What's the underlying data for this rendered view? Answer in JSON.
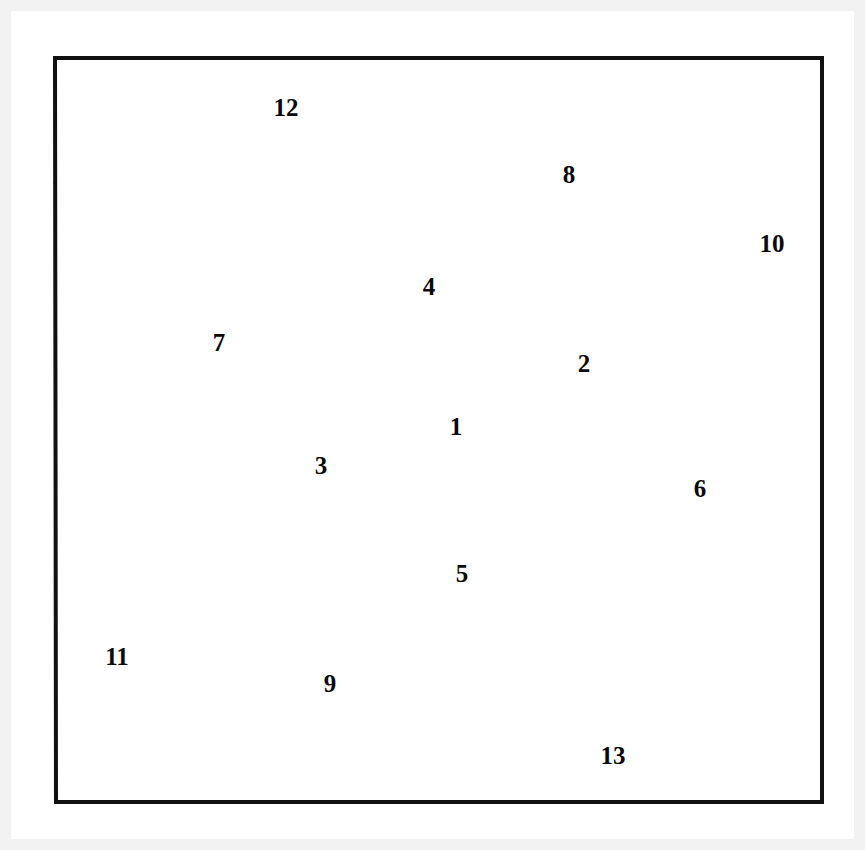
{
  "figure": {
    "title_visible": false,
    "background_color": "#ffffff",
    "matte_color": "#f2f2f2",
    "line_color": "#111111",
    "label_color": "#0a0a0a",
    "frame": {
      "stroke_width": 4,
      "points": "55,58 822,58 822,802 56,802"
    },
    "partition_stroke_width": 2.6,
    "region_count": 13,
    "regions": [
      {
        "id": "region-1",
        "label": "1",
        "label_x": 456,
        "label_y": 429,
        "polygon": "312,364 503,317 563,502 363,515"
      },
      {
        "id": "region-2",
        "label": "2",
        "label_x": 584,
        "label_y": 366,
        "polygon": "503,317 653,275 598,493 563,502"
      },
      {
        "id": "region-3",
        "label": "3",
        "label_x": 321,
        "label_y": 468,
        "polygon": "280,368 312,364 363,515 228,586"
      },
      {
        "id": "region-4",
        "label": "4",
        "label_x": 429,
        "label_y": 289,
        "polygon": "310,228 662,247 653,275 503,317 312,364 280,368"
      },
      {
        "id": "region-5",
        "label": "5",
        "label_x": 462,
        "label_y": 576,
        "polygon": "228,586 363,515 563,502 598,493 566,633 162,615"
      },
      {
        "id": "region-6",
        "label": "6",
        "label_x": 700,
        "label_y": 491,
        "polygon": "653,275 717,247 779,648 566,633 598,493"
      },
      {
        "id": "region-7",
        "label": "7",
        "label_x": 219,
        "label_y": 345,
        "polygon": "97,215 310,228 280,368 228,586 162,615"
      },
      {
        "id": "region-8",
        "label": "8",
        "label_x": 569,
        "label_y": 177,
        "polygon": "88,183 695,110 717,247 662,247 310,228 97,215"
      },
      {
        "id": "region-9",
        "label": "9",
        "label_x": 330,
        "label_y": 686,
        "polygon": "162,615 566,633 779,648 787,681 183,753"
      },
      {
        "id": "region-10",
        "label": "10",
        "label_x": 772,
        "label_y": 246,
        "polygon": "695,110 822,92 822,678 787,681 779,648 717,247"
      },
      {
        "id": "region-11",
        "label": "11",
        "label_x": 117,
        "label_y": 659,
        "polygon": "55,183 88,183 162,615 183,753 56,769"
      },
      {
        "id": "region-12",
        "label": "12",
        "label_x": 286,
        "label_y": 110,
        "polygon": "55,58 822,58 822,92 695,110 88,183 55,183"
      },
      {
        "id": "region-13",
        "label": "13",
        "label_x": 613,
        "label_y": 758,
        "polygon": "56,769 183,753 787,681 822,678 822,802 56,802"
      }
    ],
    "partition_edges": [
      {
        "name": "edge-12-bottom",
        "points": "55,183 88,183 695,110 822,92"
      },
      {
        "name": "edge-8-bottom-left",
        "points": "88,183 97,215 310,228 662,247 717,247"
      },
      {
        "name": "edge-7-4",
        "points": "310,228 280,368"
      },
      {
        "name": "edge-4-bottom",
        "points": "280,368 312,364 503,317 653,275 662,247"
      },
      {
        "name": "edge-1-3",
        "points": "312,364 363,515"
      },
      {
        "name": "edge-1-2",
        "points": "503,317 563,502"
      },
      {
        "name": "edge-1-5",
        "points": "363,515 563,502 598,493"
      },
      {
        "name": "edge-2-6",
        "points": "653,275 598,493 566,633"
      },
      {
        "name": "edge-7-3-5",
        "points": "280,368 228,586 162,615"
      },
      {
        "name": "edge-3-5-bottom",
        "points": "228,586 363,515"
      },
      {
        "name": "edge-5-9",
        "points": "162,615 566,633 779,648"
      },
      {
        "name": "edge-6-9-right",
        "points": "779,648 787,681"
      },
      {
        "name": "edge-8-10",
        "points": "695,110 717,247 779,648"
      },
      {
        "name": "edge-11-right",
        "points": "88,183 162,615 183,753"
      },
      {
        "name": "edge-13-top",
        "points": "56,769 183,753 787,681 822,678"
      }
    ]
  }
}
